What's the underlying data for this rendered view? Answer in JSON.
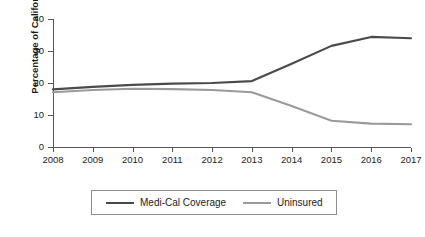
{
  "chart_data": {
    "type": "line",
    "title": "",
    "xlabel": "",
    "ylabel": "Percentage of Californians",
    "x": [
      2008,
      2009,
      2010,
      2011,
      2012,
      2013,
      2014,
      2015,
      2016,
      2017
    ],
    "xtick_labels": [
      "2008",
      "2009",
      "2010",
      "2011",
      "2012",
      "2013",
      "2014",
      "2015",
      "2016",
      "2017"
    ],
    "ytick_labels": [
      "0",
      "10",
      "20",
      "30",
      "40"
    ],
    "yticks": [
      0,
      10,
      20,
      30,
      40
    ],
    "ylim": [
      0,
      40
    ],
    "xlim": [
      2008,
      2017
    ],
    "grid": false,
    "legend_position": "bottom-center",
    "series": [
      {
        "name": "Medi-Cal Coverage",
        "color": "#4a4a4a",
        "values": [
          18.0,
          18.8,
          19.4,
          19.8,
          20.0,
          20.6,
          26.0,
          31.6,
          34.4,
          34.0
        ]
      },
      {
        "name": "Uninsured",
        "color": "#9a9a9a",
        "values": [
          17.1,
          17.8,
          18.2,
          18.1,
          17.8,
          17.1,
          12.8,
          8.2,
          7.3,
          7.1
        ]
      }
    ]
  },
  "legend": {
    "entries": [
      {
        "label": "Medi-Cal Coverage",
        "color": "#4a4a4a"
      },
      {
        "label": "Uninsured",
        "color": "#9a9a9a"
      }
    ]
  },
  "axes": {
    "y_title": "Percentage of Californians"
  }
}
